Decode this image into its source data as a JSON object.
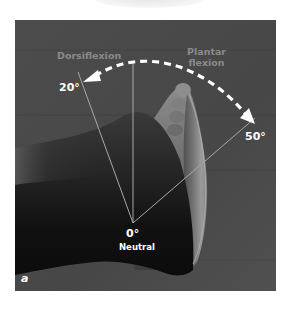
{
  "figure": {
    "panel_label": "a",
    "labels": {
      "dorsiflexion": "Dorsiflexion",
      "plantar_flexion_line1": "Plantar",
      "plantar_flexion_line2": "flexion",
      "dorsiflexion_angle": "20°",
      "plantar_flexion_angle": "50°",
      "neutral_angle": "0°",
      "neutral_label": "Neutral"
    },
    "colors": {
      "background": "#4a4a4a",
      "annotation_line": "#a8a8a8",
      "arc": "#ffffff",
      "label_text": "#ffffff",
      "motion_text": "#8a8a8a",
      "skin_dark": "#141414",
      "sole_light": "#9a9a9a"
    }
  }
}
